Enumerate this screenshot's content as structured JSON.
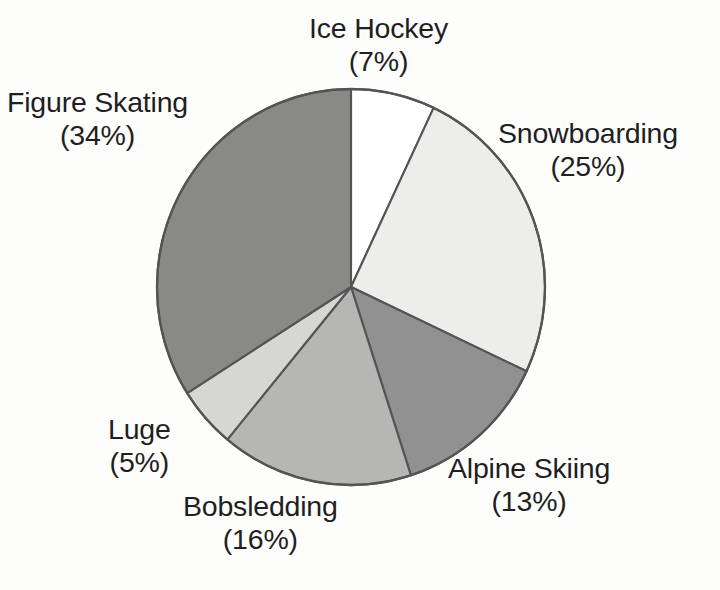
{
  "figure": {
    "name": "winter-sports-pie-chart",
    "background_color": "#fdfdfc",
    "outline_color": "#545454",
    "bleed_through": {
      "line1": "e parc",
      "line2": "lc"
    }
  },
  "chart_data": {
    "type": "pie",
    "title": "",
    "subtitle": "",
    "xlabel": "",
    "ylabel": "",
    "legend_position": "none",
    "labels_position": "outside-callout",
    "grid": false,
    "units": "percent",
    "total": 100,
    "start_angle_deg": 0,
    "direction": "clockwise",
    "categories": [
      "Ice Hockey",
      "Snowboarding",
      "Alpine Skiing",
      "Bobsledding",
      "Luge",
      "Figure Skating"
    ],
    "values": [
      7,
      25,
      13,
      16,
      5,
      34
    ],
    "colors": [
      "#ffffff",
      "#ededec",
      "#919191",
      "#b6b6b5",
      "#d6d6d4",
      "#898988"
    ],
    "slices": [
      {
        "id": "ice-hockey",
        "label": "Ice Hockey",
        "percent_text": "(7%)",
        "value": 7,
        "color": "#ffffff",
        "start_deg": 0,
        "end_deg": 25.2
      },
      {
        "id": "snowboarding",
        "label": "Snowboarding",
        "percent_text": "(25%)",
        "value": 25,
        "color": "#ededec",
        "start_deg": 25.2,
        "end_deg": 115.2
      },
      {
        "id": "alpine-skiing",
        "label": "Alpine Skiing",
        "percent_text": "(13%)",
        "value": 13,
        "color": "#919191",
        "start_deg": 115.2,
        "end_deg": 162.0
      },
      {
        "id": "bobsledding",
        "label": "Bobsledding",
        "percent_text": "(16%)",
        "value": 16,
        "color": "#b6b6b5",
        "start_deg": 162.0,
        "end_deg": 219.6
      },
      {
        "id": "luge",
        "label": "Luge",
        "percent_text": "(5%)",
        "value": 5,
        "color": "#d6d6d4",
        "start_deg": 219.6,
        "end_deg": 237.6
      },
      {
        "id": "figure-skating",
        "label": "Figure Skating",
        "percent_text": "(34%)",
        "value": 34,
        "color": "#898988",
        "start_deg": 237.6,
        "end_deg": 360.0
      }
    ],
    "geometry": {
      "center_x": 351,
      "center_y": 287,
      "radius_x": 194,
      "radius_y": 198
    }
  }
}
